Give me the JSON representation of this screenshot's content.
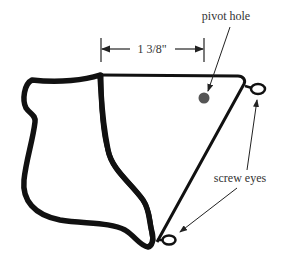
{
  "diagram": {
    "dimension": {
      "label": "1 3/8\""
    },
    "labels": {
      "pivot_hole": "pivot hole",
      "screw_eyes": "screw eyes"
    },
    "colors": {
      "outline": "#111111",
      "pivot_hole": "#555555",
      "text": "#333333",
      "background": "#ffffff"
    }
  }
}
